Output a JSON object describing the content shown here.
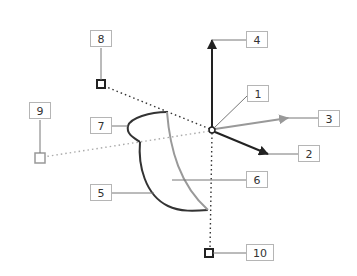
{
  "diagram": {
    "type": "technical-callout-diagram",
    "callouts": [
      {
        "id": "1",
        "label": "1"
      },
      {
        "id": "2",
        "label": "2"
      },
      {
        "id": "3",
        "label": "3"
      },
      {
        "id": "4",
        "label": "4"
      },
      {
        "id": "5",
        "label": "5"
      },
      {
        "id": "6",
        "label": "6"
      },
      {
        "id": "7",
        "label": "7"
      },
      {
        "id": "8",
        "label": "8"
      },
      {
        "id": "9",
        "label": "9"
      },
      {
        "id": "10",
        "label": "10"
      }
    ],
    "colors": {
      "dark": "#222222",
      "gray": "#999999",
      "box_border": "#b5b5b5"
    }
  }
}
